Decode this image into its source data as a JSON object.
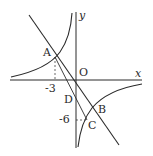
{
  "diagram": {
    "type": "coordinate-graph",
    "axes": {
      "x_label": "x",
      "y_label": "y",
      "origin_label": "O"
    },
    "points": {
      "A": {
        "label": "A",
        "coords": [
          -3,
          null
        ]
      },
      "B": {
        "label": "B"
      },
      "C": {
        "label": "C",
        "y": -6
      },
      "D": {
        "label": "D"
      },
      "O": {
        "label": "O"
      }
    },
    "tick_labels": {
      "x_tick": "-3",
      "y_tick": "-6"
    },
    "curves": [
      "hyperbola-upper-left-branch",
      "hyperbola-lower-right-branch"
    ],
    "lines": [
      "line-AOB",
      "segment-AC"
    ],
    "guides": [
      "dashed-A-to-x-axis",
      "dashed-y-axis-to-C"
    ],
    "colors": {
      "stroke": "#2a2a2a",
      "background": "#ffffff"
    }
  }
}
